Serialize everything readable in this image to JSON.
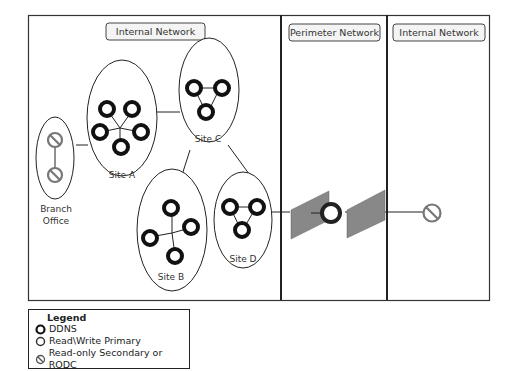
{
  "zones": [
    {
      "label": "Internal Network"
    },
    {
      "label": "Perimeter Network"
    },
    {
      "label": "Internal Network"
    }
  ],
  "sites": [
    {
      "label": "Site A",
      "servers": 5,
      "type": "ddns"
    },
    {
      "label": "Site B",
      "servers": 4,
      "type": "ddns"
    },
    {
      "label": "Site C",
      "servers": 3,
      "type": "ddns"
    },
    {
      "label": "Site D",
      "servers": 3,
      "type": "ddns"
    },
    {
      "label_line1": "Branch",
      "label_line2": "Office",
      "servers": 2,
      "type": "rodc"
    }
  ],
  "perimeter": {
    "firewalls": 2,
    "server": "read-write-primary"
  },
  "external_internal": {
    "server": "rodc"
  },
  "legend": {
    "title": "Legend",
    "items": [
      {
        "icon": "ddns-icon",
        "label": "DDNS"
      },
      {
        "icon": "read-write-primary-icon",
        "label": "Read\\Write Primary"
      },
      {
        "icon": "rodc-icon",
        "label": "Read-only Secondary or RODC"
      }
    ]
  },
  "colors": {
    "ddns": "#111111",
    "primary": "#222222",
    "rodc": "#777777",
    "firewall": "#888888"
  }
}
